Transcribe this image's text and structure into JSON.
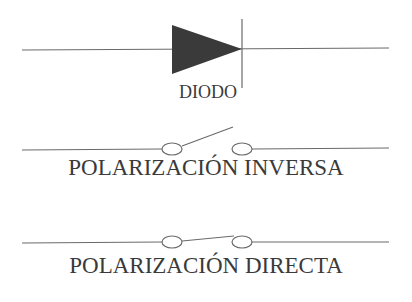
{
  "diagram": {
    "symbols": [
      {
        "id": "diode",
        "label": "DIODO"
      },
      {
        "id": "reverse_bias",
        "label": "POLARIZACIÓN INVERSA",
        "switch_state": "open"
      },
      {
        "id": "forward_bias",
        "label": "POLARIZACIÓN DIRECTA",
        "switch_state": "closed"
      }
    ]
  },
  "colors": {
    "line": "#6a6a6a",
    "fill": "#3a3a3a",
    "text": "#3a3a3a"
  }
}
